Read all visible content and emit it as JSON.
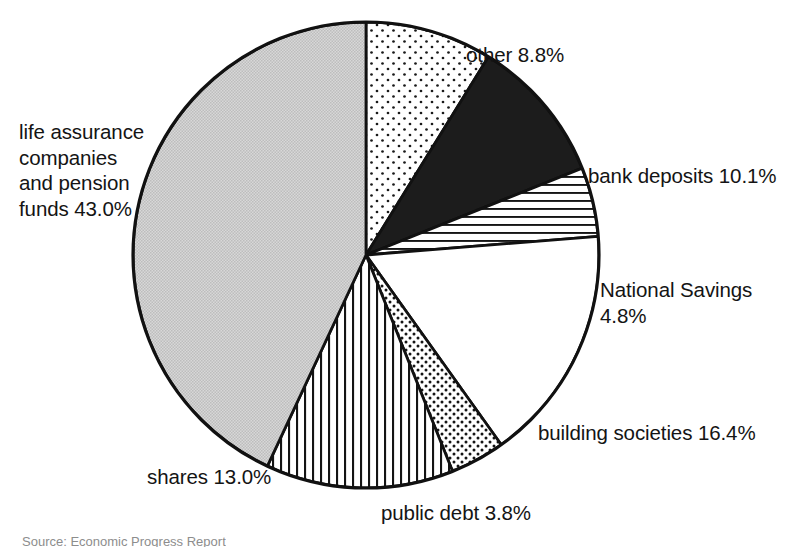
{
  "figure": {
    "background_color": "#ffffff",
    "outline_color": "#111111",
    "caption": "Source: Economic Progress Report"
  },
  "chart_data": {
    "type": "pie",
    "title": "",
    "subtitle": "",
    "xlabel": "",
    "ylabel": "",
    "legend_position": "none",
    "grid": false,
    "units": "percent",
    "total": 99.9,
    "start_angle_deg": 0,
    "direction": "clockwise",
    "center": {
      "x": 366,
      "y": 255
    },
    "radius": 233,
    "categories": [
      "other",
      "bank deposits",
      "National Savings",
      "building societies",
      "public debt",
      "shares",
      "life assurance companies and pension funds"
    ],
    "values": [
      8.8,
      10.1,
      4.8,
      16.4,
      3.8,
      13.0,
      43.0
    ],
    "slices": [
      {
        "name": "other",
        "value": 8.8,
        "label": "other 8.8%",
        "fill": "sparse-dots",
        "fill_color": "#ffffff",
        "pattern_ink": "#141414"
      },
      {
        "name": "bank deposits",
        "value": 10.1,
        "label": "bank deposits 10.1%",
        "fill": "solid-black",
        "fill_color": "#1c1c1c",
        "pattern_ink": "#1c1c1c"
      },
      {
        "name": "National Savings",
        "value": 4.8,
        "label": "National Savings\n4.8%",
        "label_line1": "National Savings",
        "label_line2": "4.8%",
        "fill": "horizontal-lines",
        "fill_color": "#ffffff",
        "pattern_ink": "#141414"
      },
      {
        "name": "building societies",
        "value": 16.4,
        "label": "building societies 16.4%",
        "fill": "blank-white",
        "fill_color": "#ffffff",
        "pattern_ink": "#141414"
      },
      {
        "name": "public debt",
        "value": 3.8,
        "label": "public debt 3.8%",
        "fill": "dense-dots",
        "fill_color": "#ffffff",
        "pattern_ink": "#141414"
      },
      {
        "name": "shares",
        "value": 13.0,
        "label": "shares 13.0%",
        "fill": "vertical-lines",
        "fill_color": "#ffffff",
        "pattern_ink": "#141414"
      },
      {
        "name": "life assurance companies and pension funds",
        "value": 43.0,
        "label": "life assurance\ncompanies\nand pension\nfunds 43.0%",
        "label_line1": "life assurance",
        "label_line2": "companies",
        "label_line3": "and pension",
        "label_line4": "funds 43.0%",
        "fill": "light-grey-stipple",
        "fill_color": "#cfcfcf",
        "pattern_ink": "#9a9a9a"
      }
    ]
  }
}
